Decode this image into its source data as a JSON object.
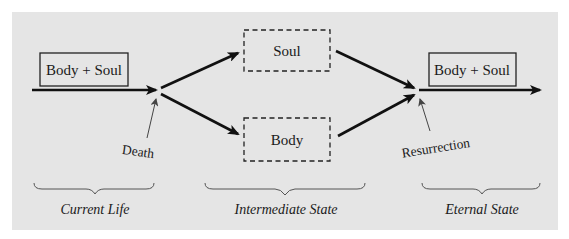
{
  "diagram": {
    "colors": {
      "panel_background": "#e5e5e5",
      "page_background": "#ffffff",
      "ink": "#111111",
      "thin_line": "#555555"
    },
    "boxes": {
      "start": {
        "label": "Body + Soul",
        "style": "solid"
      },
      "soul": {
        "label": "Soul",
        "style": "dashed"
      },
      "body": {
        "label": "Body",
        "style": "dashed"
      },
      "end": {
        "label": "Body + Soul",
        "style": "solid"
      }
    },
    "events": {
      "death": "Death",
      "resurrection": "Resurrection"
    },
    "phases": [
      {
        "label": "Current Life"
      },
      {
        "label": "Intermediate State"
      },
      {
        "label": "Eternal State"
      }
    ]
  }
}
